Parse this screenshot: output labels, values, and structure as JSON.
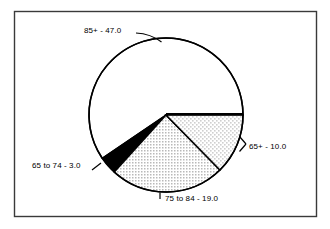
{
  "figure": {
    "background_color": "#ffffff",
    "border_color": "#3a3a3a",
    "frame": {
      "x": 14,
      "y": 11,
      "width": 303,
      "height": 206
    }
  },
  "chart_data": {
    "type": "pie",
    "title": "",
    "subtitle": "",
    "xlabel": "",
    "ylabel": "",
    "legend_position": "none",
    "grid": false,
    "total": 79.0,
    "start_angle_deg": 0,
    "direction": "clockwise",
    "center": {
      "x": 166,
      "y": 115
    },
    "radius": 77,
    "categories": [
      "65+",
      "75 to 84",
      "65 to 74",
      "85+"
    ],
    "values": [
      10.0,
      19.0,
      3.0,
      47.0
    ],
    "labels": [
      "65+ - 10.0",
      "75 to 84 - 19.0",
      "65 to 74 - 3.0",
      "85+ - 47.0"
    ],
    "slices": [
      {
        "name": "65+",
        "value": 10.0,
        "label": "65+ - 10.0",
        "fill": "light-stipple",
        "fill_color": "#ededed",
        "edge_color": "#000000",
        "start_deg": 0,
        "end_deg": 45.6,
        "label_position": "right"
      },
      {
        "name": "75 to 84",
        "value": 19.0,
        "label": "75 to 84 - 19.0",
        "fill": "dotted-stipple",
        "fill_color": "#e3e3e3",
        "edge_color": "#000000",
        "start_deg": 45.6,
        "end_deg": 132.2,
        "label_position": "bottom"
      },
      {
        "name": "65 to 74",
        "value": 3.0,
        "label": "65 to 74 - 3.0",
        "fill": "solid-black",
        "fill_color": "#000000",
        "edge_color": "#000000",
        "start_deg": 132.2,
        "end_deg": 145.9,
        "label_position": "left"
      },
      {
        "name": "85+",
        "value": 47.0,
        "label": "85+ - 47.0",
        "fill": "white",
        "fill_color": "#ffffff",
        "edge_color": "#000000",
        "start_deg": 145.9,
        "end_deg": 360,
        "label_position": "top"
      }
    ]
  }
}
